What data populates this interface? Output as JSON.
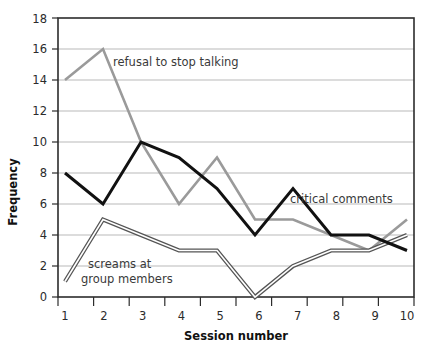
{
  "chart_data": {
    "type": "line",
    "title": "",
    "xlabel": "Session number",
    "ylabel": "Frequency",
    "categories": [
      "1",
      "2",
      "3",
      "4",
      "5",
      "6",
      "7",
      "8",
      "9",
      "10"
    ],
    "ylim": [
      0,
      18
    ],
    "ytick_step": 2,
    "yticks": [
      "0",
      "2",
      "4",
      "6",
      "8",
      "10",
      "12",
      "14",
      "16",
      "18"
    ],
    "grid": "horizontal",
    "legend": "inline-annotations",
    "series": [
      {
        "name": "refusal to stop talking",
        "color": "#9a9a9a",
        "values": [
          14,
          16,
          10,
          6,
          9,
          5,
          5,
          4,
          3,
          5
        ]
      },
      {
        "name": "critical comments",
        "color": "#111111",
        "values": [
          8,
          6,
          10,
          9,
          7,
          4,
          7,
          4,
          4,
          3
        ]
      },
      {
        "name": "screams at group members",
        "color": "#555555",
        "values": [
          1,
          5,
          4,
          3,
          3,
          0,
          2,
          3,
          3,
          4
        ]
      }
    ],
    "annotations": [
      {
        "text": "refusal to stop talking",
        "x": 113,
        "y": 62
      },
      {
        "text": "critical comments",
        "x": 288,
        "y": 199
      },
      {
        "text": "screams at group members",
        "line1": "screams at",
        "line2": "group members",
        "x": 88,
        "y": 264
      }
    ]
  }
}
